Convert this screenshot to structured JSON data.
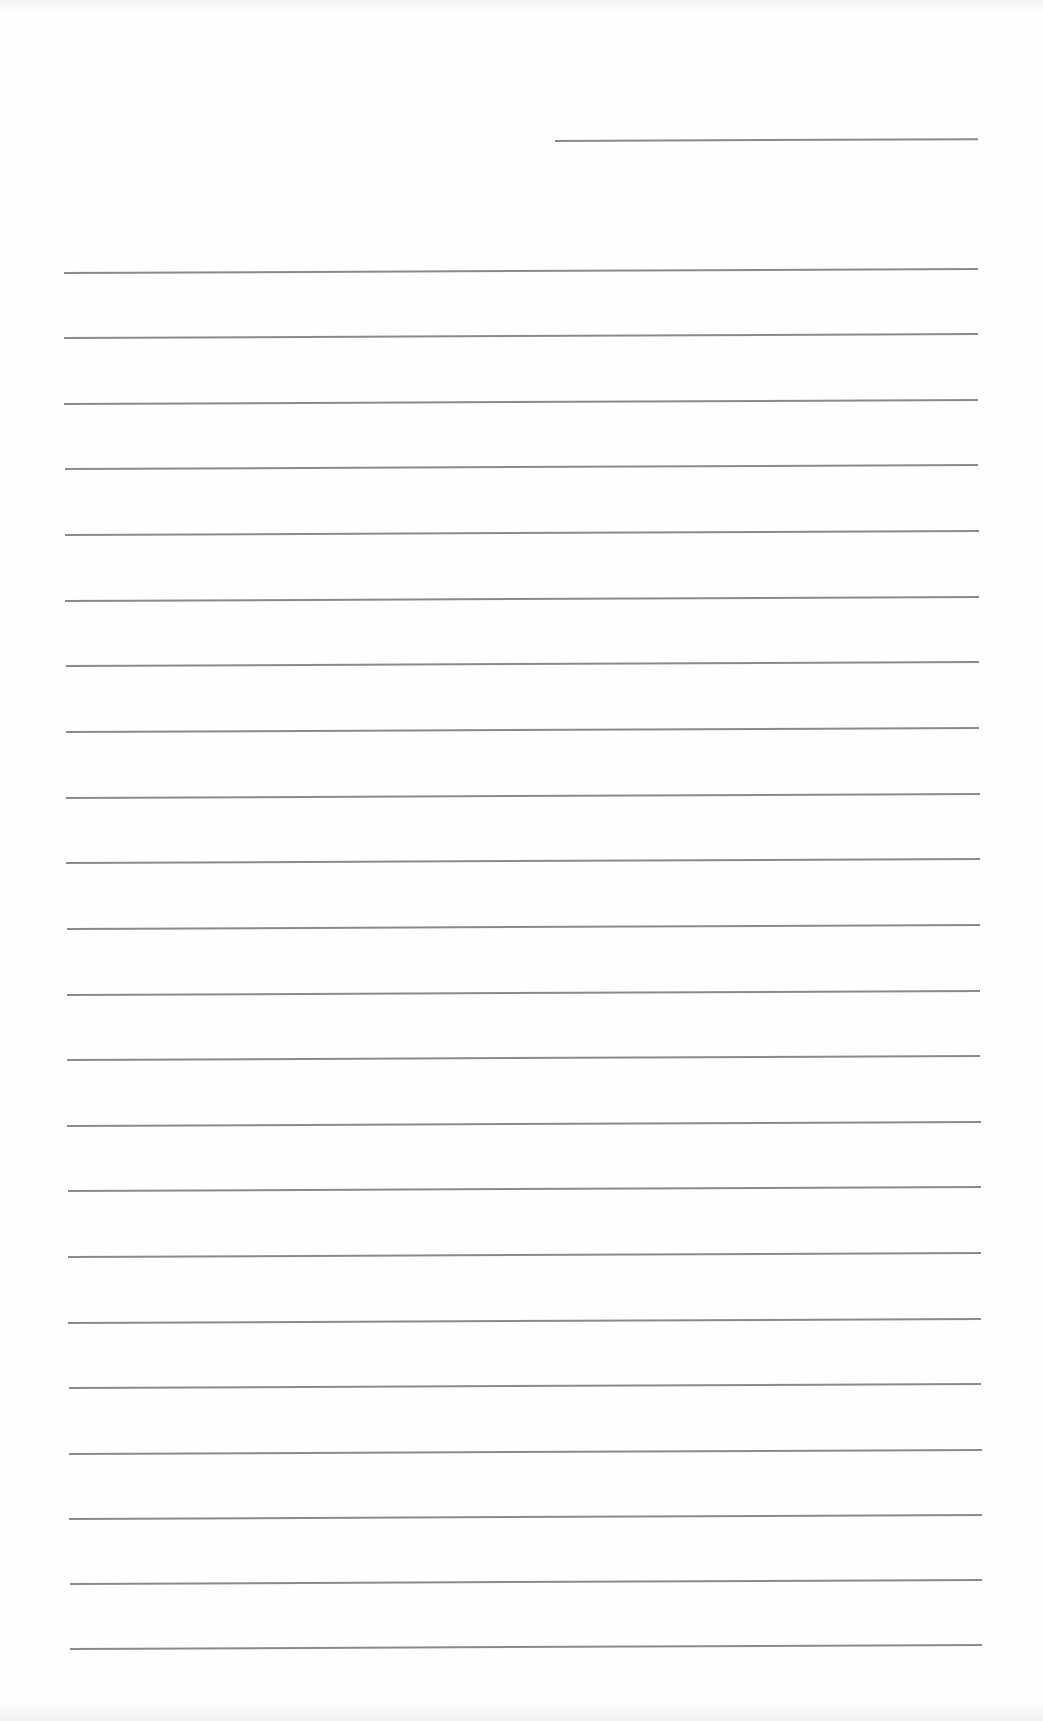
{
  "document": {
    "type": "lined-paper",
    "background_color": "#fefefe",
    "line_color": "#8a8a8a",
    "header_line": {
      "x1": 555,
      "x2": 978,
      "y": 140
    },
    "lines": [
      {
        "x1": 64,
        "x2": 978,
        "y": 272
      },
      {
        "x1": 64,
        "x2": 978,
        "y": 337
      },
      {
        "x1": 64,
        "x2": 978,
        "y": 403
      },
      {
        "x1": 65,
        "x2": 978,
        "y": 468
      },
      {
        "x1": 65,
        "x2": 979,
        "y": 534
      },
      {
        "x1": 65,
        "x2": 979,
        "y": 600
      },
      {
        "x1": 66,
        "x2": 979,
        "y": 665
      },
      {
        "x1": 66,
        "x2": 979,
        "y": 731
      },
      {
        "x1": 66,
        "x2": 980,
        "y": 797
      },
      {
        "x1": 66,
        "x2": 980,
        "y": 862
      },
      {
        "x1": 67,
        "x2": 980,
        "y": 928
      },
      {
        "x1": 67,
        "x2": 980,
        "y": 994
      },
      {
        "x1": 67,
        "x2": 980,
        "y": 1059
      },
      {
        "x1": 67,
        "x2": 981,
        "y": 1125
      },
      {
        "x1": 68,
        "x2": 981,
        "y": 1190
      },
      {
        "x1": 68,
        "x2": 981,
        "y": 1256
      },
      {
        "x1": 68,
        "x2": 981,
        "y": 1322
      },
      {
        "x1": 69,
        "x2": 981,
        "y": 1387
      },
      {
        "x1": 69,
        "x2": 982,
        "y": 1453
      },
      {
        "x1": 69,
        "x2": 982,
        "y": 1518
      },
      {
        "x1": 70,
        "x2": 982,
        "y": 1583
      },
      {
        "x1": 70,
        "x2": 982,
        "y": 1648
      }
    ]
  }
}
